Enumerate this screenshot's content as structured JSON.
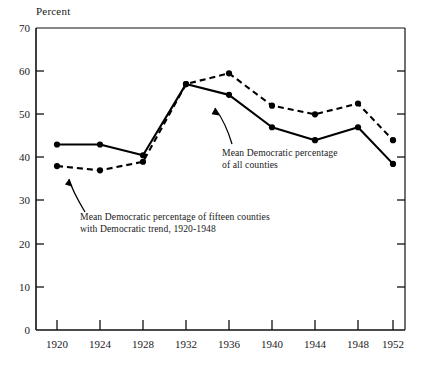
{
  "chart_data": {
    "type": "line",
    "title": "",
    "xlabel": "",
    "ylabel": "Percent",
    "categories": [
      "1920",
      "1924",
      "1928",
      "1932",
      "1936",
      "1940",
      "1944",
      "1948",
      "1952"
    ],
    "x": [
      1920,
      1924,
      1928,
      1932,
      1936,
      1940,
      1944,
      1948,
      1952
    ],
    "xlim": [
      1918,
      1954
    ],
    "ylim": [
      0,
      70
    ],
    "ytick_labels": [
      "0",
      "10",
      "20",
      "30",
      "40",
      "50",
      "60",
      "70"
    ],
    "yticks": [
      0,
      10,
      20,
      30,
      40,
      50,
      60,
      70
    ],
    "grid": false,
    "legend_position": "inline-annotations",
    "series": [
      {
        "name": "Mean Democratic percentage of fifteen counties with Democratic trend, 1920-1948",
        "style": "solid",
        "marker": "filled-circle",
        "color": "#000000",
        "values": [
          43.0,
          43.0,
          40.5,
          57.0,
          54.5,
          47.0,
          44.0,
          47.0,
          38.5
        ]
      },
      {
        "name": "Mean Democratic percentage of all counties",
        "style": "dashed",
        "marker": "filled-circle",
        "color": "#000000",
        "values": [
          38.0,
          37.0,
          39.0,
          57.0,
          59.5,
          52.0,
          50.0,
          52.5,
          44.0
        ]
      }
    ],
    "annotations": [
      {
        "id": "annotation-all-counties",
        "line1": "Mean Democratic percentage",
        "line2": "of all counties",
        "points_to_series": "Mean Democratic percentage of fifteen counties with Democratic trend, 1920-1948"
      },
      {
        "id": "annotation-fifteen-counties",
        "line1": "Mean Democratic percentage of fifteen counties",
        "line2": "with Democratic trend, 1920-1948",
        "points_to_series": "Mean Democratic percentage of all counties"
      }
    ]
  },
  "axis": {
    "y_axis_label": "Percent",
    "y_ticks": [
      "70",
      "60",
      "50",
      "40",
      "30",
      "20",
      "10",
      "0"
    ],
    "x_ticks": [
      "1920",
      "1924",
      "1928",
      "1932",
      "1936",
      "1940",
      "1944",
      "1948",
      "1952"
    ]
  },
  "annotations": {
    "all_counties": {
      "line1": "Mean Democratic percentage",
      "line2": "of all counties"
    },
    "fifteen_counties": {
      "line1": "Mean Democratic percentage of fifteen counties",
      "line2": "with Democratic trend, 1920-1948"
    }
  },
  "colors": {
    "ink": "#000000",
    "background": "#ffffff"
  }
}
